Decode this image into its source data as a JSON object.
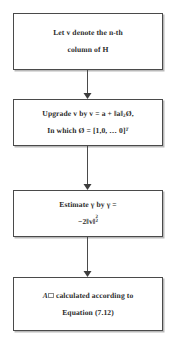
{
  "diagram": {
    "type": "flowchart",
    "orientation": "vertical",
    "colors": {
      "box_border": "#4a4a4a",
      "box_fill": "#ffffff",
      "text": "#2b2b2b",
      "arrow": "#3d3d3d",
      "shadow": "#b9b9b9",
      "background": "#ffffff"
    },
    "nodes": [
      {
        "id": "node-1",
        "shape": "rectangle",
        "line1": "Let v denote the n-th",
        "line2": "column of H"
      },
      {
        "id": "node-2",
        "shape": "rectangle",
        "line1_prefix": "Upgrade v by v = a + ",
        "line1_norm": "‖a‖",
        "line1_norm_sub": "2",
        "line1_suffix": "Ø,",
        "line2_prefix": "In which Ø = ",
        "line2_vector": "[1,0, … 0]",
        "line2_transpose": "T"
      },
      {
        "id": "node-3",
        "shape": "rectangle",
        "line1": "Estimate γ by γ =",
        "line2_prefix": "−2",
        "line2_norm": "‖v‖",
        "line2_sup": "2",
        "line2_sub": "2"
      },
      {
        "id": "node-4",
        "shape": "rectangle",
        "line1_symbol": "A",
        "line1_text": " calculated according to",
        "line2": "Equation (7.12)"
      }
    ],
    "connectors": [
      {
        "id": "arrow-1",
        "from": "node-1",
        "to": "node-2",
        "style": "solid-arrow-down"
      },
      {
        "id": "arrow-2",
        "from": "node-2",
        "to": "node-3",
        "style": "solid-arrow-down"
      },
      {
        "id": "arrow-3",
        "from": "node-3",
        "to": "node-4",
        "style": "solid-arrow-down"
      }
    ]
  }
}
